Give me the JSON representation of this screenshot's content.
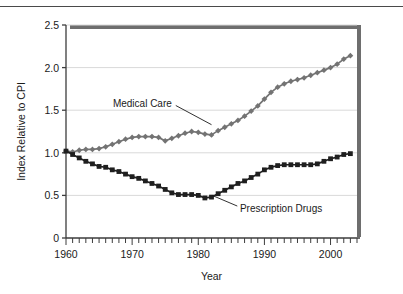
{
  "figure": {
    "background_color": "#ffffff",
    "rule_color": "#4a4a4a",
    "plot_bg": "#ffffff",
    "axis_color": "#3d3d3d",
    "grid_color": "#d9d9d9",
    "shadow_color": "#6e6e6e"
  },
  "chart_data": {
    "type": "line",
    "title": "",
    "subtitle": "",
    "xlabel": "Year",
    "ylabel": "Index Relative to CPI",
    "xlim": [
      1960,
      2004
    ],
    "ylim": [
      0,
      2.5
    ],
    "xticks": [
      1960,
      1970,
      1980,
      1990,
      2000
    ],
    "xtick_labels": [
      "1960",
      "1970",
      "1980",
      "1990",
      "2000"
    ],
    "minor_xtick_interval": 1,
    "yticks": [
      0,
      0.5,
      1.0,
      1.5,
      2.0,
      2.5
    ],
    "ytick_labels": [
      "0",
      "0.5",
      "1.0",
      "1.5",
      "2.0",
      "2.5"
    ],
    "grid": "horizontal",
    "legend": "inline-annotations",
    "x": [
      1960,
      1961,
      1962,
      1963,
      1964,
      1965,
      1966,
      1967,
      1968,
      1969,
      1970,
      1971,
      1972,
      1973,
      1974,
      1975,
      1976,
      1977,
      1978,
      1979,
      1980,
      1981,
      1982,
      1983,
      1984,
      1985,
      1986,
      1987,
      1988,
      1989,
      1990,
      1991,
      1992,
      1993,
      1994,
      1995,
      1996,
      1997,
      1998,
      1999,
      2000,
      2001,
      2002,
      2003
    ],
    "series": [
      {
        "name": "Medical Care",
        "color": "#737373",
        "marker": "diamond",
        "values": [
          1.02,
          1.01,
          1.03,
          1.04,
          1.04,
          1.05,
          1.07,
          1.1,
          1.13,
          1.16,
          1.18,
          1.19,
          1.19,
          1.19,
          1.18,
          1.14,
          1.17,
          1.2,
          1.23,
          1.25,
          1.24,
          1.22,
          1.21,
          1.26,
          1.3,
          1.34,
          1.38,
          1.43,
          1.49,
          1.55,
          1.63,
          1.71,
          1.77,
          1.81,
          1.84,
          1.86,
          1.88,
          1.91,
          1.94,
          1.97,
          2.0,
          2.04,
          2.1,
          2.14
        ]
      },
      {
        "name": "Prescription Drugs",
        "color": "#1f1f1f",
        "marker": "square",
        "values": [
          1.02,
          0.98,
          0.94,
          0.9,
          0.87,
          0.84,
          0.83,
          0.8,
          0.78,
          0.75,
          0.72,
          0.7,
          0.67,
          0.64,
          0.61,
          0.57,
          0.53,
          0.51,
          0.51,
          0.51,
          0.5,
          0.47,
          0.48,
          0.52,
          0.56,
          0.6,
          0.64,
          0.67,
          0.71,
          0.75,
          0.8,
          0.83,
          0.85,
          0.86,
          0.86,
          0.86,
          0.86,
          0.86,
          0.87,
          0.9,
          0.93,
          0.95,
          0.98,
          0.99
        ]
      }
    ],
    "annotations": [
      {
        "text": "Medical Care",
        "text_x": 1976.0,
        "text_y": 1.58,
        "anchor": "end",
        "leader_from_x": 1976.6,
        "leader_from_y": 1.555,
        "leader_to_x": 1982.0,
        "leader_to_y": 1.33
      },
      {
        "text": "Prescription Drugs",
        "text_x": 1986.3,
        "text_y": 0.345,
        "anchor": "start",
        "leader_from_x": 1985.9,
        "leader_from_y": 0.375,
        "leader_to_x": 1982.1,
        "leader_to_y": 0.5
      }
    ]
  }
}
